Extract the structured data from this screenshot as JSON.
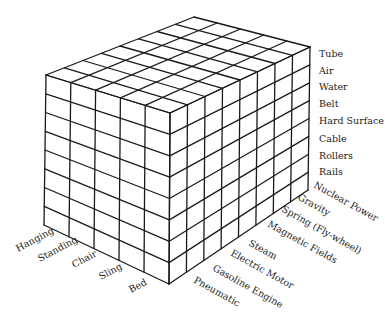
{
  "diagram": {
    "type": "morphological-box",
    "axes": {
      "vertical_right": {
        "name": "medium",
        "labels": [
          "Tube",
          "Air",
          "Water",
          "Belt",
          "Hard Surface",
          "Cable",
          "Rollers",
          "Rails"
        ]
      },
      "left_face": {
        "name": "passenger-support",
        "labels": [
          "Hanging",
          "Standing",
          "Chair",
          "Sling",
          "Bed"
        ]
      },
      "right_face": {
        "name": "power-source",
        "labels": [
          "Pneumatic",
          "Gasoline Engine",
          "Electric Motor",
          "Steam",
          "Magnetic Fields",
          "Spring (Fly-wheel)",
          "Gravity",
          "Nuclear Power"
        ]
      }
    },
    "stroke_color": "#1a1a1a",
    "label_color": "#222222"
  }
}
